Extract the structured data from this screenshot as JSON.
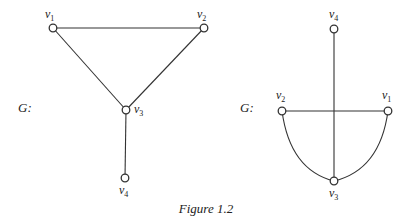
{
  "caption": "Figure 1.2",
  "graphs": [
    {
      "name": "G:",
      "nodes": [
        {
          "id": "v1",
          "base": "v",
          "sub": "1"
        },
        {
          "id": "v2",
          "base": "v",
          "sub": "2"
        },
        {
          "id": "v3",
          "base": "v",
          "sub": "3"
        },
        {
          "id": "v4",
          "base": "v",
          "sub": "4"
        }
      ],
      "edges": [
        [
          "v1",
          "v2"
        ],
        [
          "v1",
          "v3"
        ],
        [
          "v2",
          "v3"
        ],
        [
          "v3",
          "v4"
        ]
      ]
    },
    {
      "name": "G:",
      "nodes": [
        {
          "id": "v1",
          "base": "v",
          "sub": "1"
        },
        {
          "id": "v2",
          "base": "v",
          "sub": "2"
        },
        {
          "id": "v3",
          "base": "v",
          "sub": "3"
        },
        {
          "id": "v4",
          "base": "v",
          "sub": "4"
        }
      ],
      "edges": [
        [
          "v1",
          "v2"
        ],
        [
          "v1",
          "v3"
        ],
        [
          "v2",
          "v3"
        ],
        [
          "v3",
          "v4"
        ]
      ]
    }
  ]
}
